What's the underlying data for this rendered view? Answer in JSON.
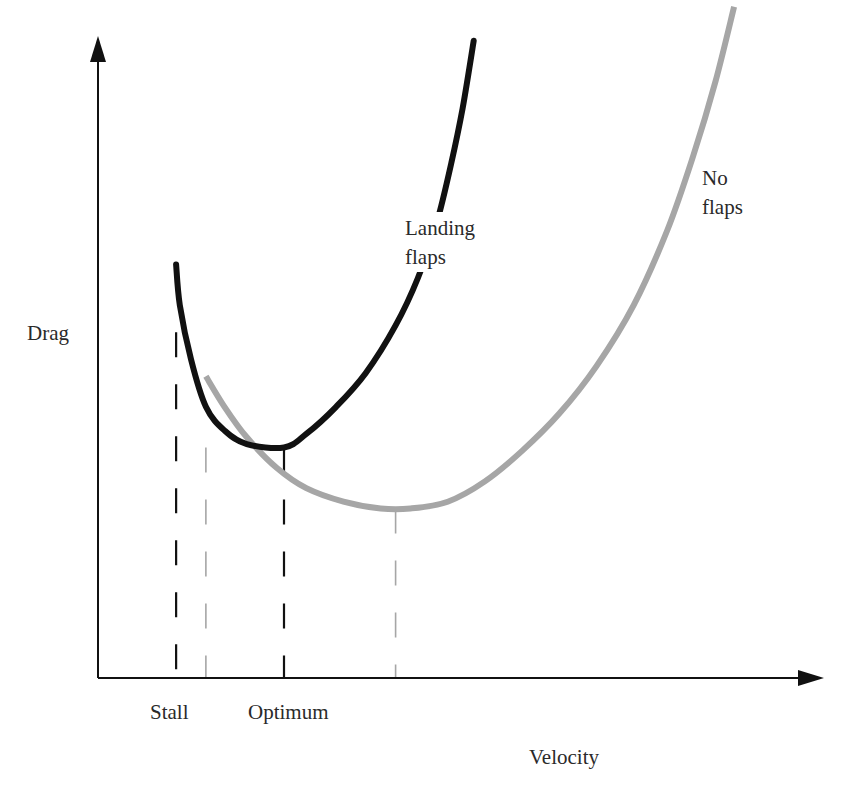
{
  "chart_data": {
    "type": "line",
    "title": "",
    "xlabel": "Velocity",
    "ylabel": "Drag",
    "xlim": [
      0,
      100
    ],
    "ylim": [
      0,
      100
    ],
    "grid": false,
    "ticks_numeric": false,
    "series": [
      {
        "name": "Landing flaps",
        "label_lines": [
          "Landing",
          "flaps"
        ],
        "color": "#111111",
        "points": [
          [
            10.5,
            61
          ],
          [
            11,
            55
          ],
          [
            12.5,
            47
          ],
          [
            14.5,
            40
          ],
          [
            17,
            36.5
          ],
          [
            20,
            34.5
          ],
          [
            25,
            34
          ],
          [
            28,
            36
          ],
          [
            32,
            40
          ],
          [
            36,
            45
          ],
          [
            40,
            52
          ],
          [
            43,
            59
          ],
          [
            45.5,
            67
          ],
          [
            47.5,
            76
          ],
          [
            49,
            84
          ],
          [
            50.5,
            94
          ]
        ]
      },
      {
        "name": "No flaps",
        "label_lines": [
          "No",
          "flaps"
        ],
        "color": "#a6a6a6",
        "points": [
          [
            14.5,
            44.5
          ],
          [
            17,
            40
          ],
          [
            20,
            35.5
          ],
          [
            24,
            31
          ],
          [
            28,
            28
          ],
          [
            33,
            26
          ],
          [
            38,
            25
          ],
          [
            42,
            25
          ],
          [
            47,
            26
          ],
          [
            52,
            29
          ],
          [
            57,
            33.5
          ],
          [
            62,
            39
          ],
          [
            67,
            46
          ],
          [
            72,
            55
          ],
          [
            76.5,
            66
          ],
          [
            80,
            77
          ],
          [
            83,
            88
          ],
          [
            85.5,
            99
          ]
        ]
      }
    ],
    "reference_lines": [
      {
        "name": "stall-landing",
        "x": 10.5,
        "style": "dashed",
        "color": "#111111",
        "y_top": 51
      },
      {
        "name": "stall-no-flaps",
        "x": 14.5,
        "style": "dashed",
        "color": "#a6a6a6",
        "y_top": 34
      },
      {
        "name": "optimum-landing",
        "x": 25,
        "style": "dashed",
        "color": "#111111",
        "y_top": 34
      },
      {
        "name": "optimum-no-flaps",
        "x": 40,
        "style": "dashed",
        "color": "#a6a6a6",
        "y_top": 25
      }
    ],
    "annotations": [
      {
        "text": "Stall",
        "x": 10.5
      },
      {
        "text": "Optimum",
        "x": 25
      }
    ]
  }
}
